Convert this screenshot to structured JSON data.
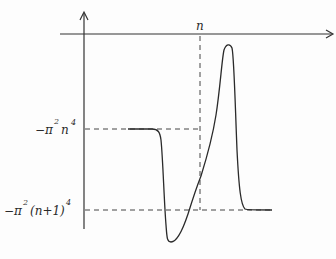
{
  "diagram": {
    "type": "function-sketch",
    "axes": {
      "x_axis": {
        "has_arrow": true
      },
      "y_axis": {
        "has_arrow": true
      }
    },
    "labels": {
      "x_tick": "n",
      "y_upper_prefix": "−π",
      "y_upper_sup1": "2",
      "y_upper_mid": "n",
      "y_upper_sup2": "4",
      "y_lower_prefix": "−π",
      "y_lower_sup1": "2",
      "y_lower_mid": "(n+1)",
      "y_lower_sup2": "4"
    },
    "reference_levels": {
      "upper": "-π²n⁴",
      "lower": "-π²(n+1)⁴",
      "vertical": "n"
    },
    "curve_description": "Flat at -π²n⁴, drops sharply below -π²(n+1)⁴ to a minimum, rises through x=n to a sharp positive peak, then drops and settles flat at -π²(n+1)⁴",
    "colors": {
      "ink": "#2a2a2a",
      "background": "#fdfdfd"
    }
  }
}
